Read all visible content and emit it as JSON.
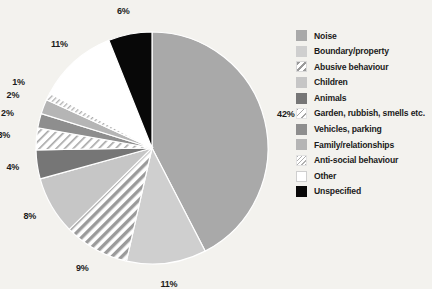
{
  "chart_data": {
    "type": "pie",
    "title": "",
    "xlabel": "",
    "ylabel": "",
    "legend_position": "right",
    "grid": false,
    "categories": [
      "Noise",
      "Boundary/property",
      "Abusive behaviour",
      "Children",
      "Animals",
      "Garden, rubbish, smells etc.",
      "Vehicles, parking",
      "Family/relationships",
      "Anti-social behaviour",
      "Other",
      "Unspecified"
    ],
    "values": [
      42,
      11,
      9,
      8,
      4,
      3,
      2,
      2,
      1,
      11,
      6
    ],
    "value_labels": [
      "42%",
      "11%",
      "9%",
      "8%",
      "4%",
      "3%",
      "2%",
      "2%",
      "1%",
      "11%",
      "6%"
    ],
    "slice_styles": [
      {
        "name": "Noise",
        "fill": "#a9a9a9",
        "pattern": "solid"
      },
      {
        "name": "Boundary/property",
        "fill": "#cfcfcf",
        "pattern": "solid"
      },
      {
        "name": "Abusive behaviour",
        "fill": "#ffffff",
        "pattern": "diagonal-hatch-bold"
      },
      {
        "name": "Children",
        "fill": "#c6c6c6",
        "pattern": "solid"
      },
      {
        "name": "Animals",
        "fill": "#767676",
        "pattern": "solid"
      },
      {
        "name": "Garden, rubbish, smells etc.",
        "fill": "#ffffff",
        "pattern": "diagonal-hatch-sparse"
      },
      {
        "name": "Vehicles, parking",
        "fill": "#8e8e8e",
        "pattern": "solid"
      },
      {
        "name": "Family/relationships",
        "fill": "#b5b5b5",
        "pattern": "solid"
      },
      {
        "name": "Anti-social behaviour",
        "fill": "#ffffff",
        "pattern": "diagonal-hatch-fine"
      },
      {
        "name": "Other",
        "fill": "#ffffff",
        "pattern": "solid"
      },
      {
        "name": "Unspecified",
        "fill": "#080808",
        "pattern": "solid"
      }
    ],
    "background_color": "#f3f2ee",
    "label_color": "#1b1b1b"
  },
  "legend": {
    "items": [
      {
        "label": "Noise"
      },
      {
        "label": "Boundary/property"
      },
      {
        "label": "Abusive behaviour"
      },
      {
        "label": "Children"
      },
      {
        "label": "Animals"
      },
      {
        "label": "Garden, rubbish, smells etc."
      },
      {
        "label": "Vehicles, parking"
      },
      {
        "label": "Family/relationships"
      },
      {
        "label": "Anti-social behaviour"
      },
      {
        "label": "Other"
      },
      {
        "label": "Unspecified"
      }
    ]
  }
}
